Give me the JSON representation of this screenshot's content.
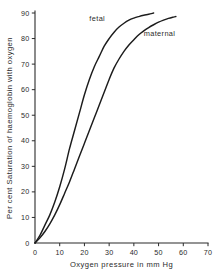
{
  "chart_data": {
    "type": "line",
    "title": "",
    "xlabel": "Oxygen pressure in mm Hg",
    "ylabel": "Per cent Saturation of haemoglobin with oxygen",
    "xlim": [
      0,
      70
    ],
    "ylim": [
      0,
      90
    ],
    "xticks": [
      0,
      10,
      20,
      30,
      40,
      50,
      60,
      70
    ],
    "yticks": [
      0,
      10,
      20,
      30,
      40,
      50,
      60,
      70,
      80,
      90
    ],
    "xtick_labels": [
      "0",
      "10",
      "20",
      "30",
      "40",
      "50",
      "60",
      "70"
    ],
    "ytick_labels": [
      "0",
      "10",
      "20",
      "30",
      "40",
      "50",
      "60",
      "70",
      "80",
      "90"
    ],
    "grid": false,
    "legend_position": "inline-annotation",
    "line_color": "#1c1c1c",
    "axis_color": "#2b2b2b",
    "background_color": "#ffffff",
    "series": [
      {
        "name": "fetal",
        "label": "fetal",
        "label_x": 22,
        "label_y": 87,
        "x": [
          0,
          2,
          4,
          6,
          8,
          10,
          12,
          14,
          16,
          18,
          20,
          22,
          24,
          26,
          28,
          30,
          32,
          34,
          36,
          38,
          40,
          42,
          44,
          46,
          48
        ],
        "y": [
          0,
          3,
          7,
          11,
          16,
          22,
          29,
          37,
          44,
          51,
          58,
          64,
          69,
          73,
          77,
          80,
          82.5,
          84.5,
          86,
          87.2,
          88,
          88.6,
          89.1,
          89.5,
          90
        ]
      },
      {
        "name": "maternal",
        "label": "maternal",
        "label_x": 44,
        "label_y": 81,
        "x": [
          0,
          2,
          4,
          6,
          8,
          10,
          12,
          14,
          16,
          18,
          20,
          22,
          24,
          26,
          28,
          30,
          32,
          34,
          36,
          38,
          40,
          42,
          44,
          46,
          48,
          50,
          52,
          54,
          56,
          57
        ],
        "y": [
          0,
          2,
          4.5,
          7.5,
          11,
          15,
          19.5,
          24,
          29,
          34,
          39,
          44,
          49,
          54,
          59,
          64,
          68.5,
          72,
          75,
          77.5,
          79.5,
          81.5,
          83,
          84.3,
          85.4,
          86.4,
          87.2,
          87.9,
          88.4,
          88.6
        ]
      }
    ]
  }
}
